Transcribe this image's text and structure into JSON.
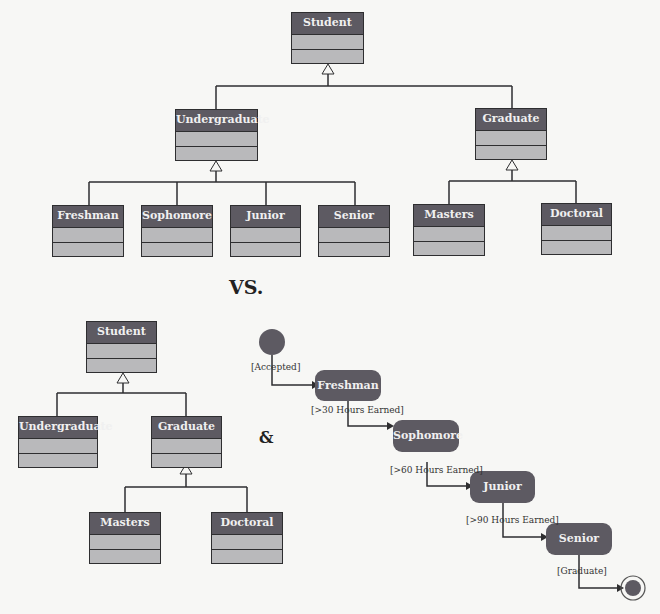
{
  "top_diagram": {
    "root": "Student",
    "level1": [
      "Undergraduate",
      "Graduate"
    ],
    "undergraduate_children": [
      "Freshman",
      "Sophomore",
      "Junior",
      "Senior"
    ],
    "graduate_children": [
      "Masters",
      "Doctoral"
    ]
  },
  "separator": "VS.",
  "bottom_class_diagram": {
    "root": "Student",
    "level1": [
      "Undergraduate",
      "Graduate"
    ],
    "graduate_children": [
      "Masters",
      "Doctoral"
    ]
  },
  "ampersand": "&",
  "state_diagram": {
    "states": [
      "Freshman",
      "Sophomore",
      "Junior",
      "Senior"
    ],
    "guards": [
      "[Accepted]",
      "[>30 Hours Earned]",
      "[>60 Hours Earned]",
      "[>90 Hours Earned]",
      "[Graduate]"
    ]
  },
  "colors": {
    "header": "#5d5a62",
    "compartment": "#b9b9bb",
    "line": "#2e2e30"
  }
}
